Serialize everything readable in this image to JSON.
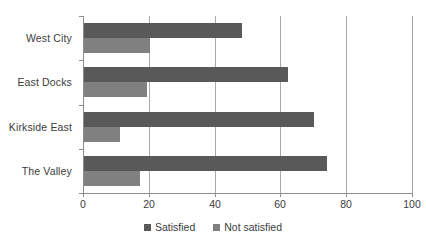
{
  "chart_data": {
    "type": "bar",
    "orientation": "horizontal",
    "title": "",
    "subtitle": "",
    "xlabel": "",
    "ylabel": "",
    "xlim": [
      0,
      100
    ],
    "xticks": [
      0,
      20,
      40,
      60,
      80,
      100
    ],
    "grid": "vertical",
    "legend_position": "bottom-center",
    "categories": [
      "West City",
      "East Docks",
      "Kirkside East",
      "The Valley"
    ],
    "series": [
      {
        "name": "Satisfied",
        "color": "#595959",
        "values": [
          48,
          62,
          70,
          74
        ]
      },
      {
        "name": "Not satisfied",
        "color": "#808080",
        "values": [
          20,
          19,
          11,
          17
        ]
      }
    ]
  },
  "legend": {
    "items": [
      {
        "label": "Satisfied",
        "swatch": "satisfied"
      },
      {
        "label": "Not satisfied",
        "swatch": "notsatisfied"
      }
    ]
  },
  "colors": {
    "satisfied": "#595959",
    "not_satisfied": "#808080",
    "axis": "#8c8c8c",
    "gridline": "#a8a8a8",
    "text": "#3c3c3c",
    "background": "#ffffff"
  }
}
